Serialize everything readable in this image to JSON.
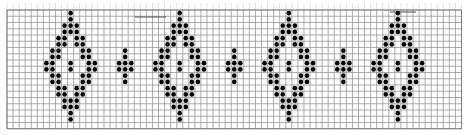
{
  "chart": {
    "grid": {
      "left": 7,
      "top": 10,
      "columns": 75,
      "rows": 19,
      "cell_width": 6.06,
      "cell_height": 6.25,
      "line_color": "#8a8a8a",
      "border_color": "#6f6f6f",
      "background": "#ffffff"
    },
    "dot": {
      "color": "#000000",
      "radius": 2.3
    },
    "motifs": {
      "large_diamond": {
        "rows": [
          [
            0
          ],
          [
            0
          ],
          [
            -1,
            0,
            1
          ],
          [
            -1,
            0,
            1
          ],
          [
            -2,
            -1,
            1,
            2
          ],
          [
            -2,
            -1,
            1,
            2
          ],
          [
            -3,
            -2,
            2,
            3
          ],
          [
            -3,
            -2,
            2,
            3
          ],
          [
            -4,
            -3,
            0,
            3,
            4
          ],
          [
            -4,
            -3,
            0,
            3,
            4
          ],
          [
            -3,
            -2,
            2,
            3
          ],
          [
            -3,
            -2,
            2,
            3
          ],
          [
            -2,
            -1,
            1,
            2
          ],
          [
            -2,
            -1,
            1,
            2
          ],
          [
            -1,
            0,
            1
          ],
          [
            -1,
            0,
            1
          ],
          [
            0
          ],
          [
            0
          ]
        ],
        "start_row": 0
      },
      "small_diamond": {
        "rows": [
          [
            0
          ],
          [
            0
          ],
          [
            -1,
            0,
            1
          ],
          [
            -1,
            0,
            1
          ],
          [
            0
          ],
          [
            0
          ]
        ],
        "start_row": 6
      }
    },
    "placements": [
      {
        "motif": "large_diamond",
        "center_col": 10
      },
      {
        "motif": "small_diamond",
        "center_col": 19
      },
      {
        "motif": "large_diamond",
        "center_col": 28
      },
      {
        "motif": "small_diamond",
        "center_col": 37
      },
      {
        "motif": "large_diamond",
        "center_col": 46
      },
      {
        "motif": "small_diamond",
        "center_col": 55
      },
      {
        "motif": "large_diamond",
        "center_col": 64
      }
    ],
    "marks": [
      {
        "x1": 135,
        "x2": 166,
        "y": 17,
        "color": "#555555"
      },
      {
        "x1": 390,
        "x2": 416,
        "y": 12,
        "color": "#555555"
      }
    ]
  }
}
